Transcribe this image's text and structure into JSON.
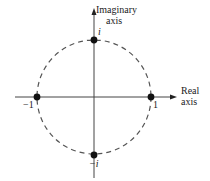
{
  "diagram": {
    "axes": {
      "imaginary": {
        "label_line1": "Imaginary",
        "label_line2": "axis"
      },
      "real": {
        "label_line1": "Real",
        "label_line2": "axis"
      }
    },
    "circle": {
      "center": [
        0,
        0
      ],
      "radius": 1,
      "style": "dashed"
    },
    "points": [
      {
        "label": "i",
        "re": 0,
        "im": 1
      },
      {
        "label": "1",
        "re": 1,
        "im": 0
      },
      {
        "label": "−1",
        "re": -1,
        "im": 0
      },
      {
        "label": "−i",
        "re": 0,
        "im": -1
      }
    ],
    "colors": {
      "ink": "#222222",
      "dash": "#555555",
      "background": "#ffffff"
    }
  }
}
